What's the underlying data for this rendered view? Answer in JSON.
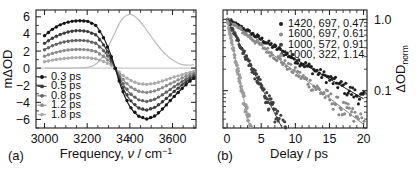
{
  "figure": {
    "panel_a_label": "(a)",
    "panel_b_label": "(b)"
  },
  "panel_a": {
    "ylabel": "mΔOD",
    "xlabel_main": "Frequency, ",
    "xlabel_symbol": "ν",
    "xlabel_unit": " / cm",
    "xlabel_exp": "−1",
    "xticks": [
      "3000",
      "3200",
      "3400",
      "3600"
    ],
    "yticks": [
      "6",
      "4",
      "2",
      "0",
      "−2",
      "−4",
      "−6"
    ],
    "legend": [
      {
        "label": "0.3 ps",
        "color": "#141414"
      },
      {
        "label": "0.5 ps",
        "color": "#3c3c3c"
      },
      {
        "label": "0.8 ps",
        "color": "#646464"
      },
      {
        "label": "1.2 ps",
        "color": "#8c8c8c"
      },
      {
        "label": "1.8 ps",
        "color": "#ababab"
      }
    ],
    "spectrum_color": "#c0c0c0"
  },
  "panel_b": {
    "ylabel": "ΔOD",
    "ylabel_sub": "norm",
    "xlabel": "Delay / ps",
    "xticks": [
      "0",
      "5",
      "10",
      "15",
      "20"
    ],
    "yticks": [
      "1.0",
      "0.1"
    ],
    "legend": [
      {
        "label": "1420, 697, 0.47",
        "color": "#1e1e1e"
      },
      {
        "label": "1600, 697, 0.61",
        "color": "#8a8a8a"
      },
      {
        "label": "1000, 572, 0.91",
        "color": "#404040"
      },
      {
        "label": "1000, 322, 1.14",
        "color": "#9c9c9c"
      }
    ]
  },
  "chart_data": [
    {
      "type": "line",
      "panel": "a",
      "title": "",
      "xlabel": "Frequency, ν̃ / cm⁻¹",
      "ylabel": "mΔOD",
      "xlim": [
        2960,
        3710
      ],
      "ylim": [
        -7.0,
        6.8
      ],
      "grid": false,
      "legend_position": "lower-left",
      "x": [
        3000,
        3040,
        3080,
        3120,
        3160,
        3200,
        3240,
        3280,
        3320,
        3360,
        3400,
        3440,
        3480,
        3520,
        3560,
        3600,
        3640,
        3680,
        3700
      ],
      "series": [
        {
          "name": "0.3 ps",
          "color": "#141414",
          "values": [
            3.8,
            4.6,
            5.15,
            5.45,
            5.55,
            5.5,
            5.0,
            3.4,
            0.9,
            -2.3,
            -4.5,
            -5.6,
            -5.95,
            -5.55,
            -4.6,
            -3.5,
            -2.5,
            -1.55,
            -1.2
          ]
        },
        {
          "name": "0.5 ps",
          "color": "#3c3c3c",
          "values": [
            2.9,
            3.55,
            4.0,
            4.3,
            4.4,
            4.3,
            3.9,
            2.6,
            0.7,
            -1.9,
            -3.7,
            -4.65,
            -4.9,
            -4.55,
            -3.8,
            -2.9,
            -2.05,
            -1.3,
            -1.0
          ]
        },
        {
          "name": "0.8 ps",
          "color": "#646464",
          "values": [
            2.15,
            2.65,
            3.0,
            3.2,
            3.25,
            3.2,
            2.9,
            1.95,
            0.55,
            -1.5,
            -2.95,
            -3.7,
            -3.9,
            -3.6,
            -3.0,
            -2.3,
            -1.65,
            -1.05,
            -0.8
          ]
        },
        {
          "name": "1.2 ps",
          "color": "#8c8c8c",
          "values": [
            1.4,
            1.75,
            2.0,
            2.15,
            2.2,
            2.15,
            1.95,
            1.3,
            0.4,
            -1.1,
            -2.15,
            -2.7,
            -2.85,
            -2.65,
            -2.2,
            -1.7,
            -1.2,
            -0.75,
            -0.6
          ]
        },
        {
          "name": "1.8 ps",
          "color": "#ababab",
          "values": [
            0.75,
            0.95,
            1.1,
            1.2,
            1.25,
            1.22,
            1.1,
            0.75,
            0.25,
            -0.7,
            -1.4,
            -1.8,
            -1.9,
            -1.75,
            -1.45,
            -1.1,
            -0.8,
            -0.5,
            -0.4
          ]
        },
        {
          "name": "steady-state spectrum",
          "color": "#c0c0c0",
          "values": [
            0.0,
            0.0,
            0.0,
            0.0,
            0.02,
            0.1,
            0.45,
            1.6,
            3.6,
            5.6,
            6.3,
            5.7,
            4.4,
            3.0,
            1.8,
            0.95,
            0.45,
            0.35,
            0.45
          ]
        }
      ]
    },
    {
      "type": "scatter",
      "panel": "b",
      "title": "",
      "xlabel": "Delay / ps",
      "ylabel": "ΔOD_norm",
      "xlim": [
        -0.6,
        20.5
      ],
      "ylim": [
        0.03,
        1.35
      ],
      "yscale": "log",
      "grid": false,
      "legend_position": "upper-right",
      "yticks": [
        1.0,
        0.1
      ],
      "series": [
        {
          "name": "1420, 697, 0.47",
          "color": "#1e1e1e",
          "decay_ps": 7.8,
          "amplitude": 1.0,
          "x": [
            0.1,
            0.5,
            1.0,
            1.5,
            2.0,
            2.6,
            3.2,
            3.8,
            4.4,
            5.0,
            5.6,
            6.3,
            7.0,
            7.7,
            8.4,
            9.1,
            9.8,
            10.6,
            11.4,
            12.2,
            13.0,
            13.8,
            14.6,
            15.4,
            16.2,
            17.0,
            17.8,
            18.6,
            19.4
          ],
          "y": [
            1.02,
            0.95,
            0.9,
            0.83,
            0.78,
            0.72,
            0.66,
            0.61,
            0.57,
            0.52,
            0.48,
            0.44,
            0.4,
            0.36,
            0.33,
            0.3,
            0.28,
            0.25,
            0.23,
            0.21,
            0.19,
            0.17,
            0.155,
            0.14,
            0.13,
            0.12,
            0.11,
            0.1,
            0.095
          ]
        },
        {
          "name": "1600, 697, 0.61",
          "color": "#8a8a8a",
          "decay_ps": 5.9,
          "amplitude": 1.0,
          "x": [
            0.1,
            0.5,
            1.0,
            1.5,
            2.1,
            2.7,
            3.3,
            3.9,
            4.6,
            5.2,
            5.9,
            6.6,
            7.3,
            8.0,
            8.8,
            9.6,
            10.4,
            11.2,
            12.0,
            12.9,
            13.8,
            14.7,
            15.6,
            16.5,
            17.4,
            18.3
          ],
          "y": [
            1.0,
            0.92,
            0.85,
            0.78,
            0.7,
            0.63,
            0.57,
            0.51,
            0.45,
            0.4,
            0.36,
            0.31,
            0.28,
            0.25,
            0.22,
            0.19,
            0.165,
            0.145,
            0.125,
            0.11,
            0.095,
            0.082,
            0.072,
            0.062,
            0.054,
            0.047
          ]
        },
        {
          "name": "1000, 572, 0.91",
          "color": "#404040",
          "decay_ps": 2.3,
          "amplitude": 1.0,
          "x": [
            0.1,
            0.4,
            0.8,
            1.2,
            1.6,
            2.0,
            2.4,
            2.8,
            3.2,
            3.6,
            4.0,
            4.4,
            4.8,
            5.2,
            5.6,
            6.0,
            6.4,
            6.8
          ],
          "y": [
            1.0,
            0.88,
            0.75,
            0.64,
            0.54,
            0.46,
            0.39,
            0.33,
            0.28,
            0.24,
            0.2,
            0.17,
            0.145,
            0.12,
            0.1,
            0.086,
            0.072,
            0.061
          ]
        },
        {
          "name": "1000, 322, 1.14",
          "color": "#9c9c9c",
          "decay_ps": 0.95,
          "amplitude": 1.0,
          "x": [
            0.1,
            0.3,
            0.5,
            0.7,
            0.9,
            1.1,
            1.3,
            1.5,
            1.7,
            1.9,
            2.1,
            2.3,
            2.5
          ],
          "y": [
            1.0,
            0.82,
            0.68,
            0.56,
            0.46,
            0.38,
            0.315,
            0.26,
            0.215,
            0.175,
            0.145,
            0.12,
            0.098
          ]
        }
      ]
    }
  ]
}
